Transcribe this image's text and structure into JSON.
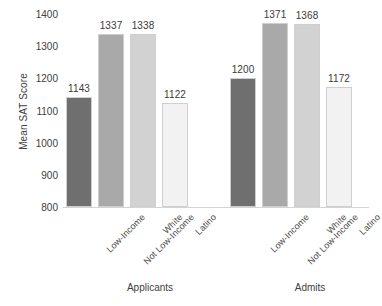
{
  "chart_data": {
    "type": "bar",
    "title": "",
    "xlabel": "",
    "ylabel": "Mean SAT Score",
    "ylim": [
      800,
      1400
    ],
    "ytick_step": 100,
    "yticks": [
      1400,
      1300,
      1200,
      1100,
      1000,
      900,
      800
    ],
    "grid": false,
    "legend": "none",
    "categories": [
      "Low-Income",
      "Not Low-Income",
      "White",
      "Latino"
    ],
    "groups": [
      "Applicants",
      "Admits"
    ],
    "series": [
      {
        "name": "Applicants",
        "values": [
          1143,
          1337,
          1338,
          1122
        ]
      },
      {
        "name": "Admits",
        "values": [
          1200,
          1371,
          1368,
          1172
        ]
      }
    ],
    "bar_colors": [
      "#6f6f6f",
      "#a9a9a9",
      "#d2d2d2",
      "#f2f2f2"
    ],
    "bar_border_color": "#cfcfcf",
    "axis_color": "#d4d4d4",
    "text_color": "#404040"
  },
  "bars": [
    {
      "label": "1143",
      "category": "Low-Income",
      "group": "Applicants",
      "value": 1143,
      "color": "#6f6f6f"
    },
    {
      "label": "1337",
      "category": "Not Low-Income",
      "group": "Applicants",
      "value": 1337,
      "color": "#a9a9a9"
    },
    {
      "label": "1338",
      "category": "White",
      "group": "Applicants",
      "value": 1338,
      "color": "#d2d2d2"
    },
    {
      "label": "1122",
      "category": "Latino",
      "group": "Applicants",
      "value": 1122,
      "color": "#f2f2f2"
    },
    {
      "label": "1200",
      "category": "Low-Income",
      "group": "Admits",
      "value": 1200,
      "color": "#6f6f6f"
    },
    {
      "label": "1371",
      "category": "Not Low-Income",
      "group": "Admits",
      "value": 1371,
      "color": "#a9a9a9"
    },
    {
      "label": "1368",
      "category": "White",
      "group": "Admits",
      "value": 1368,
      "color": "#d2d2d2"
    },
    {
      "label": "1172",
      "category": "Latino",
      "group": "Admits",
      "value": 1172,
      "color": "#f2f2f2"
    }
  ],
  "axis": {
    "y_title": "Mean SAT Score",
    "y_ticks": [
      "1400",
      "1300",
      "1200",
      "1100",
      "1000",
      "900",
      "800"
    ]
  },
  "group_labels": [
    "Applicants",
    "Admits"
  ]
}
